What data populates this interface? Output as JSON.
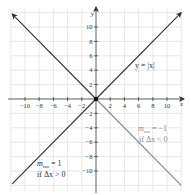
{
  "chart_data": {
    "type": "line",
    "title": "",
    "xlabel": "x",
    "ylabel": "y",
    "xlim": [
      -11.8,
      12
    ],
    "ylim": [
      -12.8,
      12.4
    ],
    "grid": true,
    "grid_step": 2,
    "x_ticks": [
      -10,
      -8,
      -6,
      -4,
      -2,
      2,
      4,
      6,
      8,
      10
    ],
    "y_ticks": [
      10,
      8,
      6,
      4,
      2,
      -2,
      -4,
      -6,
      -8,
      -10
    ],
    "x_tick_labels": [
      "−10",
      "−8",
      "−6",
      "−4",
      "−2",
      "2",
      "4",
      "6",
      "8",
      "10"
    ],
    "y_tick_labels": [
      "10",
      "8",
      "6",
      "4",
      "2",
      "−2",
      "−4",
      "−6",
      "−8",
      "−10"
    ],
    "series": [
      {
        "name": "y = |x| (x<0 branch)",
        "color": "#333333",
        "x": [
          -11.8,
          0
        ],
        "y": [
          11.8,
          0
        ],
        "arrow": "start"
      },
      {
        "name": "y = |x| (x>0 branch)",
        "color": "#333333",
        "x": [
          0,
          12
        ],
        "y": [
          0,
          12
        ],
        "arrow": "end"
      },
      {
        "name": "tangent m_tan = 1 (left extension)",
        "color": "#333333",
        "x": [
          -11.8,
          0
        ],
        "y": [
          -11.8,
          0
        ]
      },
      {
        "name": "tangent m_tan = -1 (right extension)",
        "color": "#888888",
        "x": [
          0,
          12
        ],
        "y": [
          0,
          -12
        ]
      }
    ],
    "points": [
      {
        "x": 0,
        "y": 0,
        "label": "origin"
      }
    ],
    "annotations": [
      {
        "text": "y = |x|",
        "x": 6.4,
        "y": 5.6,
        "color": "#333333"
      },
      {
        "text_main": "m",
        "text_sub": "tan",
        "text_rest": " = −1",
        "line2": "if Δx < 0",
        "x": 6.4,
        "y": -5.2,
        "color": "#888888"
      },
      {
        "text_main": "m",
        "text_sub": "tan",
        "text_rest": " = 1",
        "line2": "if Δx > 0",
        "x": -9.6,
        "y": -10.0,
        "color": "#333333"
      }
    ]
  },
  "labels": {
    "x_axis": "x",
    "y_axis": "y",
    "curve": "y = |x|",
    "right_anno_m": "m",
    "right_anno_sub": "tan",
    "right_anno_val": " = −1",
    "right_anno_cond": "if Δx < 0",
    "left_anno_m": "m",
    "left_anno_sub": "tan",
    "left_anno_val": " = 1",
    "left_anno_cond": "if Δx > 0"
  },
  "colors": {
    "grid": "#d6d6d6",
    "axis": "#333333",
    "line_dark": "#333333",
    "line_gray": "#888888"
  }
}
